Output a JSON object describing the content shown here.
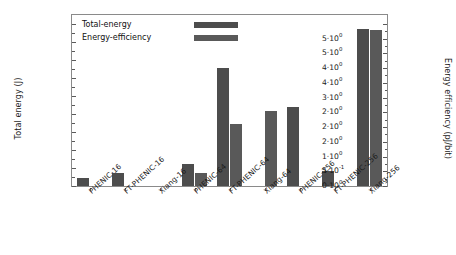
{
  "chart_data": {
    "type": "bar",
    "title": "",
    "subtitle": "",
    "xlabel": "",
    "ylabel": "Total energy (J)",
    "y2label": "Energy efficiency (pJ/bit)",
    "grid": false,
    "legend_position": "top-left-inside",
    "categories": [
      "PHENIC-16",
      "FT-PHENIC-16",
      "Xiang-16",
      "PHENIC-64",
      "FT-PHENIC-64",
      "Xiang-64",
      "PHENIC-256",
      "FT-PHENIC-256",
      "Xiang-256"
    ],
    "series": [
      {
        "name": "Total-energy",
        "axis": "left",
        "unit": "J",
        "color": "#4d4d4d",
        "values": [
          0.0045,
          0.007,
          0.0,
          0.012,
          0.0655,
          0.0,
          0.044,
          0.0085,
          0.0875
        ]
      },
      {
        "name": "Energy-efficiency",
        "axis": "right",
        "unit": "pJ/bit",
        "color": "#595959",
        "values": [
          0.0,
          0.0,
          0.0,
          0.45,
          2.1,
          2.55,
          0.0,
          0.0,
          5.3
        ]
      }
    ],
    "ylim": [
      0,
      0.095
    ],
    "y2lim": [
      0,
      5.8
    ],
    "yticks": [
      0,
      0.01,
      0.02,
      0.03,
      0.04,
      0.05,
      0.06,
      0.07,
      0.08,
      0.09
    ],
    "ytick_labels": [
      {
        "mantissa": "0",
        "exponent": "0"
      },
      {
        "mantissa": "1",
        "exponent": "-2"
      },
      {
        "mantissa": "2",
        "exponent": "-2"
      },
      {
        "mantissa": "3",
        "exponent": "-2"
      },
      {
        "mantissa": "4",
        "exponent": "-2"
      },
      {
        "mantissa": "5",
        "exponent": "-2"
      },
      {
        "mantissa": "6",
        "exponent": "-2"
      },
      {
        "mantissa": "7",
        "exponent": "-2"
      },
      {
        "mantissa": "8",
        "exponent": "-2"
      },
      {
        "mantissa": "9",
        "exponent": "-2"
      }
    ],
    "y2ticks": [
      0,
      0.5,
      1.0,
      1.5,
      2.0,
      2.5,
      3.0,
      3.5,
      4.0,
      4.5,
      5.0,
      5.5
    ],
    "y2tick_labels": [
      {
        "mantissa": "0",
        "exponent": "0"
      },
      {
        "mantissa": "5",
        "exponent": "-1"
      },
      {
        "mantissa": "1",
        "exponent": "0"
      },
      {
        "mantissa": "2",
        "exponent": "0"
      },
      {
        "mantissa": "2",
        "exponent": "0"
      },
      {
        "mantissa": "2",
        "exponent": "0"
      },
      {
        "mantissa": "3",
        "exponent": "0"
      },
      {
        "mantissa": "4",
        "exponent": "0"
      },
      {
        "mantissa": "4",
        "exponent": "0"
      },
      {
        "mantissa": "5",
        "exponent": "0"
      },
      {
        "mantissa": "5",
        "exponent": "0"
      }
    ]
  },
  "legend": {
    "items": [
      {
        "label": "Total-energy",
        "color": "#4d4d4d"
      },
      {
        "label": "Energy-efficiency",
        "color": "#595959"
      }
    ]
  },
  "axes": {
    "left_title": "Total energy (J)",
    "right_title": "Energy efficiency (pJ/bit)"
  }
}
